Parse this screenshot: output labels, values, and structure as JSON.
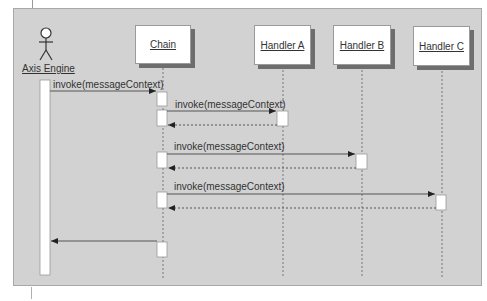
{
  "diagram": {
    "type": "sequence",
    "actor": {
      "label": "Axis Engine",
      "icon": "stick-figure-icon"
    },
    "participants": [
      {
        "label": "Chain"
      },
      {
        "label": "Handler A"
      },
      {
        "label": "Handler B"
      },
      {
        "label": "Handler C"
      }
    ],
    "messages": [
      {
        "from": "Axis Engine",
        "to": "Chain",
        "label": "invoke(messageContext)",
        "style": "solid"
      },
      {
        "from": "Chain",
        "to": "Handler A",
        "label": "invoke(messageContext)",
        "style": "solid"
      },
      {
        "from": "Handler A",
        "to": "Chain",
        "label": "",
        "style": "dashed"
      },
      {
        "from": "Chain",
        "to": "Handler B",
        "label": "invoke(messageContext)",
        "style": "solid"
      },
      {
        "from": "Handler B",
        "to": "Chain",
        "label": "",
        "style": "dashed"
      },
      {
        "from": "Chain",
        "to": "Handler C",
        "label": "invoke(messageContext)",
        "style": "solid"
      },
      {
        "from": "Handler C",
        "to": "Chain",
        "label": "",
        "style": "dashed"
      },
      {
        "from": "Chain",
        "to": "Axis Engine",
        "label": "",
        "style": "solid"
      }
    ],
    "colors": {
      "background": "#d2d2d2",
      "box_fill": "#ffffff",
      "shadow": "#6e6e6e",
      "line": "#555555"
    }
  }
}
